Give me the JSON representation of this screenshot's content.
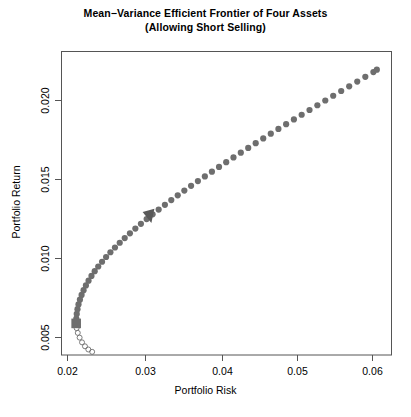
{
  "chart_data": {
    "type": "line",
    "title": "Mean−Variance Efficient Frontier of Four Assets",
    "subtitle": "(Allowing Short Selling)",
    "xlabel": "Portfolio Risk",
    "ylabel": "Portfolio Return",
    "xlim": [
      0.0185,
      0.0635
    ],
    "ylim": [
      0.0037,
      0.0229
    ],
    "xticks": [
      "0.02",
      "0.03",
      "0.04",
      "0.05",
      "0.06"
    ],
    "xtick_values": [
      0.02,
      0.03,
      0.04,
      0.05,
      0.06
    ],
    "yticks": [
      "0.005",
      "0.010",
      "0.015",
      "0.020"
    ],
    "ytick_values": [
      0.005,
      0.01,
      0.015,
      0.02
    ],
    "grid": false,
    "legend": "none",
    "series": [
      {
        "name": "Efficient frontier (upper branch)",
        "marker": "filled-circle",
        "color": "#6e6e6e",
        "x": [
          0.0205,
          0.02052,
          0.02058,
          0.02068,
          0.02082,
          0.02101,
          0.02124,
          0.02151,
          0.02183,
          0.02219,
          0.02259,
          0.02303,
          0.02351,
          0.02403,
          0.02458,
          0.02517,
          0.02579,
          0.02644,
          0.02712,
          0.02783,
          0.02857,
          0.02933,
          0.03011,
          0.03092,
          0.03175,
          0.0326,
          0.03347,
          0.03435,
          0.03525,
          0.03617,
          0.0371,
          0.03805,
          0.03901,
          0.03998,
          0.04096,
          0.04195,
          0.04295,
          0.04396,
          0.04498,
          0.04601,
          0.04704,
          0.04808,
          0.04913,
          0.05019,
          0.05125,
          0.05232,
          0.05339,
          0.05447,
          0.05555,
          0.05664,
          0.05773,
          0.05883,
          0.05993,
          0.06103,
          0.0615
        ],
        "y": [
          0.0057,
          0.006,
          0.0063,
          0.0066,
          0.0069,
          0.0072,
          0.0075,
          0.0078,
          0.0081,
          0.0084,
          0.0087,
          0.009,
          0.0093,
          0.0096,
          0.0099,
          0.0102,
          0.0105,
          0.0108,
          0.0111,
          0.0114,
          0.0117,
          0.012,
          0.0123,
          0.0126,
          0.0129,
          0.0132,
          0.0135,
          0.0138,
          0.0141,
          0.0144,
          0.0147,
          0.015,
          0.0153,
          0.0156,
          0.0159,
          0.0162,
          0.0165,
          0.0168,
          0.0171,
          0.0174,
          0.0177,
          0.018,
          0.0183,
          0.0186,
          0.0189,
          0.0192,
          0.0195,
          0.0198,
          0.0201,
          0.0204,
          0.0207,
          0.021,
          0.0213,
          0.0216,
          0.02175
        ]
      },
      {
        "name": "Inefficient frontier (lower branch)",
        "marker": "open-circle",
        "color": "#6e6e6e",
        "x": [
          0.02056,
          0.02072,
          0.02097,
          0.0213,
          0.0217,
          0.02216,
          0.02268
        ],
        "y": [
          0.0054,
          0.0051,
          0.0048,
          0.0045,
          0.00425,
          0.00405,
          0.0039
        ]
      }
    ],
    "markers": [
      {
        "name": "minimum-variance-portfolio",
        "shape": "filled-square",
        "color": "#6e6e6e",
        "x": 0.0205,
        "y": 0.0057
      },
      {
        "name": "tangency-portfolio",
        "shape": "filled-triangle-down",
        "color": "#595959",
        "x": 0.0306,
        "y": 0.0125
      }
    ],
    "colors": {
      "curve": "#6e6e6e",
      "marker": "#6e6e6e",
      "axis": "#4d4d4d",
      "text": "#000000",
      "background": "#ffffff"
    }
  },
  "title": {
    "line1": "Mean−Variance Efficient Frontier of Four Assets",
    "line2": "(Allowing Short Selling)"
  },
  "axes": {
    "x_label": "Portfolio Risk",
    "y_label": "Portfolio Return",
    "x_ticks": [
      "0.02",
      "0.03",
      "0.04",
      "0.05",
      "0.06"
    ],
    "y_ticks": [
      "0.005",
      "0.010",
      "0.015",
      "0.020"
    ]
  }
}
